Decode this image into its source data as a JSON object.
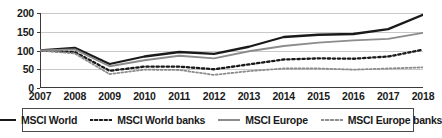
{
  "chart_data": {
    "type": "line",
    "title": "",
    "subtitle": "",
    "xlabel": "",
    "ylabel": "",
    "xlim": [
      2007,
      2018
    ],
    "ylim": [
      0,
      200
    ],
    "yticks": [
      0,
      50,
      100,
      150,
      200
    ],
    "grid": true,
    "legend_position": "bottom",
    "note": "Indexed performance, 2007 = 100",
    "categories": [
      "2007",
      "2008",
      "2009",
      "2010",
      "2011",
      "2012",
      "2013",
      "2014",
      "2015",
      "2016",
      "2017",
      "2018"
    ],
    "series": [
      {
        "name": "MSCI World",
        "style": "solid",
        "color": "#1a1a1a",
        "width": 2.3,
        "values": [
          100,
          107,
          64,
          84,
          96,
          91,
          110,
          136,
          142,
          144,
          157,
          195
        ]
      },
      {
        "name": "MSCI World banks",
        "style": "dotted",
        "color": "#1a1a1a",
        "width": 2.3,
        "values": [
          100,
          96,
          46,
          57,
          57,
          50,
          63,
          76,
          79,
          78,
          84,
          102
        ]
      },
      {
        "name": "MSCI Europe",
        "style": "solid",
        "color": "#8c8c8c",
        "width": 1.8,
        "values": [
          100,
          103,
          58,
          74,
          86,
          79,
          98,
          112,
          121,
          127,
          131,
          147
        ]
      },
      {
        "name": "MSCI Europe banks",
        "style": "dotted",
        "color": "#8c8c8c",
        "width": 1.8,
        "values": [
          100,
          92,
          37,
          49,
          48,
          35,
          45,
          52,
          52,
          49,
          52,
          55
        ]
      }
    ]
  },
  "yaxis": {
    "ticks": [
      "0",
      "50",
      "100",
      "150",
      "200"
    ]
  },
  "xaxis": {
    "ticks": [
      "2007",
      "2008",
      "2009",
      "2010",
      "2011",
      "2012",
      "2013",
      "2014",
      "2015",
      "2016",
      "2017",
      "2018"
    ]
  },
  "legend": {
    "items": [
      {
        "label": "MSCI World",
        "style": "solid",
        "color": "#1a1a1a"
      },
      {
        "label": "MSCI World banks",
        "style": "dotted",
        "color": "#1a1a1a"
      },
      {
        "label": "MSCI Europe",
        "style": "solid",
        "color": "#8c8c8c"
      },
      {
        "label": "MSCI Europe banks",
        "style": "dotted",
        "color": "#8c8c8c"
      }
    ]
  }
}
